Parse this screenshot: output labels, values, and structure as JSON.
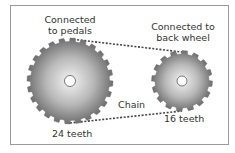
{
  "diagram": {
    "front_gear": {
      "label": "Connected to pedals",
      "label_lines": [
        "Connected",
        "to pedals"
      ],
      "teeth_label": "24 teeth",
      "teeth": 24
    },
    "rear_gear": {
      "label": "Connected to back wheel",
      "label_lines": [
        "Connected to",
        "back wheel"
      ],
      "teeth_label": "16 teeth",
      "teeth": 16
    },
    "chain": {
      "label": "Chain"
    }
  },
  "colors": {
    "frame_border": "#9a9a9a",
    "gear_light": "#f2f2f2",
    "gear_dark": "#7a7a7a",
    "chain": "#444444",
    "text": "#333333"
  }
}
